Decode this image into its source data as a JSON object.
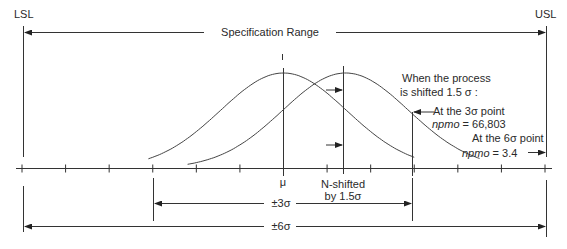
{
  "labels": {
    "lsl": "LSL",
    "usl": "USL",
    "spec_range": "Specification Range",
    "mu": "μ",
    "n_shifted_line1": "N-shifted",
    "n_shifted_line2": "by 1.5σ",
    "pm3": "±3σ",
    "pm6": "±6σ",
    "shift_note_line1": "When the process",
    "shift_note_line2": "is shifted 1.5 σ :",
    "at3_line1": "At the 3σ point",
    "at3_npmo_label": "npmo",
    "at3_npmo_value": " = 66,803",
    "at6_line1": "At the 6σ point",
    "at6_npmo_label": "npmo",
    "at6_npmo_value": " = 3.4"
  },
  "diagram": {
    "sigma_ticks": [
      -6,
      -5,
      -4,
      -3,
      -2,
      -1,
      0,
      1,
      2,
      3,
      4,
      5,
      6
    ],
    "shift_sigma": 1.5,
    "curves": [
      "centered",
      "shifted"
    ]
  }
}
